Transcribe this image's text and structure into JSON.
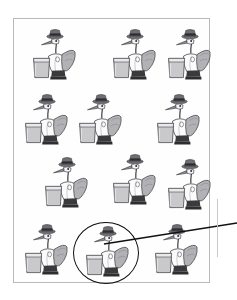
{
  "document": {
    "type": "scanned-figure-page",
    "background_color": "#ffffff"
  },
  "figure": {
    "name": "storks-with-top-hats-array",
    "frame": {
      "border_color": "#b9b9bd",
      "fill_color": "#fefefe",
      "x": 13,
      "y": 18,
      "width": 197,
      "height": 265
    },
    "item_icon_name": "stork-with-top-hat-and-glass",
    "item_count": 12,
    "rows": 4,
    "columns": 3,
    "palette": {
      "outline": "#4a4a4f",
      "hat": "#6e6e73",
      "hat_band": "#2e2e31",
      "body_light": "#fbfbfb",
      "body_shadow": "#d6d6d9",
      "wing": "#b2b2b6",
      "beak": "#8e8e93",
      "glass_fill": "#c9c9cc",
      "glass_rim": "#e3e3e5",
      "feet": "#3a3a3d"
    },
    "items": [
      {
        "id": "stork-1",
        "row": 1,
        "col": 1,
        "x": 30,
        "y": 27,
        "highlighted": false
      },
      {
        "id": "stork-2",
        "row": 1,
        "col": 2,
        "x": 110,
        "y": 27,
        "highlighted": false
      },
      {
        "id": "stork-3",
        "row": 1,
        "col": 3,
        "x": 165,
        "y": 27,
        "highlighted": false
      },
      {
        "id": "stork-4",
        "row": 2,
        "col": 1,
        "x": 22,
        "y": 92,
        "highlighted": false
      },
      {
        "id": "stork-5",
        "row": 2,
        "col": 2,
        "x": 76,
        "y": 92,
        "highlighted": false
      },
      {
        "id": "stork-6",
        "row": 2,
        "col": 3,
        "x": 154,
        "y": 92,
        "highlighted": false
      },
      {
        "id": "stork-7",
        "row": 3,
        "col": 1,
        "x": 42,
        "y": 155,
        "highlighted": false
      },
      {
        "id": "stork-8",
        "row": 3,
        "col": 2,
        "x": 110,
        "y": 152,
        "highlighted": false
      },
      {
        "id": "stork-9",
        "row": 3,
        "col": 3,
        "x": 165,
        "y": 157,
        "highlighted": false
      },
      {
        "id": "stork-10",
        "row": 4,
        "col": 1,
        "x": 22,
        "y": 222,
        "highlighted": false
      },
      {
        "id": "stork-11",
        "row": 4,
        "col": 2,
        "x": 83,
        "y": 224,
        "highlighted": true
      },
      {
        "id": "stork-12",
        "row": 4,
        "col": 3,
        "x": 152,
        "y": 222,
        "highlighted": false
      }
    ]
  },
  "annotation": {
    "circle": {
      "name": "highlight-circle",
      "target_item": "stork-11",
      "stroke_color": "#0d0d0d",
      "x": 73,
      "y": 222,
      "width": 66,
      "height": 62
    },
    "leader_line": {
      "name": "leader-line",
      "stroke_color": "#111111",
      "from_x": 105,
      "from_y": 243,
      "to_x": 237,
      "to_y": 222
    },
    "margin_rule_color": "#c9c9cc",
    "margin_note_text": "",
    "margin_note_color": "#a9a9ad"
  }
}
